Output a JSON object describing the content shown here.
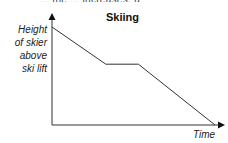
{
  "top_partial_text": "... the ... increases, a",
  "chart_data": {
    "type": "line",
    "title": "Skiing",
    "xlabel": "Time",
    "ylabel": "Height of skier above ski lift",
    "ylabel_lines": [
      "Height",
      "of skier",
      "above",
      "ski lift"
    ],
    "grid": false,
    "legend": null,
    "x_ticks": [],
    "y_ticks": [],
    "series": [
      {
        "name": "Height of skier",
        "description": "Decreases steadily, stays constant for a while, then decreases to zero",
        "x": [
          0,
          0.33,
          0.53,
          1.0
        ],
        "values": [
          1.0,
          0.62,
          0.62,
          0.0
        ]
      }
    ]
  }
}
